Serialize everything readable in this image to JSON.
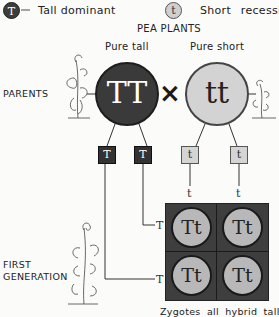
{
  "legend": {
    "dominant": {
      "symbol": "T",
      "label": "Tall dominant"
    },
    "recessive": {
      "symbol": "t",
      "label": "Short recessive"
    }
  },
  "title": "PEA PLANTS",
  "parents": {
    "row_label": "PARENTS",
    "tall": {
      "caption": "Pure tall",
      "genotype": "TT"
    },
    "short": {
      "caption": "Pure short",
      "genotype": "tt"
    },
    "cross_symbol": "×"
  },
  "gametes": {
    "tall": [
      "T",
      "T"
    ],
    "short": [
      "t",
      "t"
    ]
  },
  "punnett": {
    "column_labels": [
      "t",
      "t"
    ],
    "row_labels": [
      "T",
      "T"
    ],
    "cells": [
      "Tt",
      "Tt",
      "Tt",
      "Tt"
    ]
  },
  "first_generation": {
    "row_label_line1": "FIRST",
    "row_label_line2": "GENERATION",
    "caption": "Zygotes all hybrid tall"
  },
  "colors": {
    "dominant_fill": "#3a3a3a",
    "recessive_fill": "#d3d3d3",
    "zygote_fill": "#b8b8b8",
    "grid_fill": "#3e3e3e"
  }
}
